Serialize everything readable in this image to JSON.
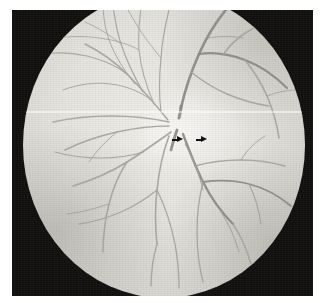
{
  "image": {
    "kind": "fundus-photograph",
    "title": "Fundus photograph of the retina",
    "modality": "Color fundus photography (monochrome print)",
    "field_shape": "circle",
    "background_color": "#100f0e",
    "retina_color": "#e7e5e0",
    "vessel_color": "#9b9992",
    "annotation_color": "#0d0d0d"
  },
  "plate": {
    "left": 12,
    "top": 10,
    "width": 301,
    "height": 286
  },
  "fundus_field": {
    "center_x": 152,
    "center_y": 135,
    "radius_x": 141,
    "radius_y": 153,
    "clipped_top": true,
    "clipped_bottom": true
  },
  "optic_disc": {
    "label": "optic disc",
    "center_x": 157,
    "center_y": 132,
    "radius": 13,
    "description": "bright pale disc with radiating retinal vessels"
  },
  "macular_reflex": {
    "label": "macular / temporal light reflex",
    "center_x": 190,
    "center_y": 145
  },
  "annotations": {
    "scanline": {
      "name": "horizontal-scan-line",
      "y": 139,
      "color": "#ffffff",
      "description": "bright horizontal artifact line crossing the whole field"
    },
    "arrows": [
      {
        "name": "arrow-1",
        "x": 172,
        "y": 139,
        "length": 11,
        "direction": "right",
        "color": "#0d0d0d"
      },
      {
        "name": "arrow-2",
        "x": 196,
        "y": 139,
        "length": 11,
        "direction": "right",
        "color": "#0d0d0d"
      }
    ]
  },
  "vessel_tree": {
    "description": "Retinal arterioles and venules radiating from the optic disc into four arcades",
    "arcades": [
      "superior nasal",
      "superior temporal",
      "inferior nasal",
      "inferior temporal"
    ]
  }
}
